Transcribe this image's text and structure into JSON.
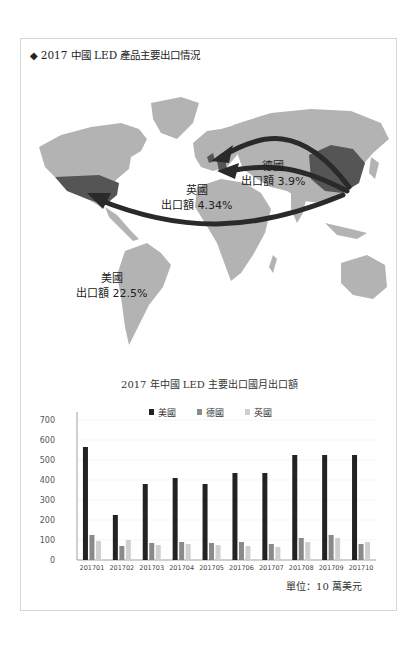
{
  "header": {
    "bullet_icon": "diamond-icon",
    "title": "2017 中國 LED 產品主要出口情況"
  },
  "map": {
    "labels": [
      {
        "country": "德國",
        "value": "出口額 3.9%"
      },
      {
        "country": "英國",
        "value": "出口額 4.34%"
      },
      {
        "country": "美國",
        "value": "出口額 22.5%"
      },
      {
        "country": "中國"
      }
    ],
    "colors": {
      "land": "#b3b3b3",
      "highlight": "#555555",
      "arrow": "#2a2a2a"
    }
  },
  "chart": {
    "title": "2017 年中國 LED 主要出口國月出口額",
    "unit": "單位：10 萬美元",
    "legend": [
      "美國",
      "德國",
      "英國"
    ]
  },
  "chart_data": {
    "type": "bar",
    "title": "2017 年中國 LED 主要出口國月出口額",
    "xlabel": "",
    "ylabel": "單位：10 萬美元",
    "categories": [
      "201701",
      "201702",
      "201703",
      "201704",
      "201705",
      "201706",
      "201707",
      "201708",
      "201709",
      "201710"
    ],
    "series": [
      {
        "name": "美國",
        "color": "#222222",
        "values": [
          565,
          225,
          380,
          410,
          380,
          435,
          435,
          525,
          525,
          525
        ]
      },
      {
        "name": "德國",
        "color": "#8a8a8a",
        "values": [
          125,
          70,
          85,
          90,
          85,
          90,
          80,
          110,
          125,
          80
        ]
      },
      {
        "name": "英國",
        "color": "#cfcfcf",
        "values": [
          95,
          100,
          75,
          80,
          75,
          70,
          65,
          90,
          110,
          90
        ]
      }
    ],
    "ylim": [
      0,
      700
    ],
    "yticks": [
      0,
      100,
      200,
      300,
      400,
      500,
      600,
      700
    ],
    "grid": true,
    "legend_position": "top"
  }
}
